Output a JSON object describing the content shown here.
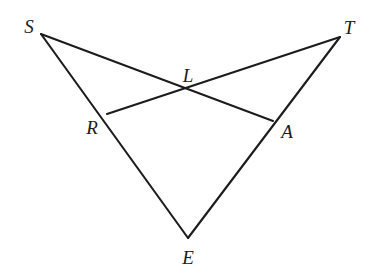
{
  "figure": {
    "type": "geometry-diagram",
    "background_color": "#ffffff",
    "stroke_color": "#1c1c1c",
    "stroke_width": 2.1,
    "canvas": {
      "width": 374,
      "height": 276
    },
    "points": [
      {
        "id": "S",
        "label": "S",
        "x": 41,
        "y": 34,
        "label_x": 29,
        "label_y": 26
      },
      {
        "id": "T",
        "label": "T",
        "x": 340,
        "y": 37,
        "label_x": 349,
        "label_y": 27
      },
      {
        "id": "L",
        "label": "L",
        "x": 188,
        "y": 91,
        "label_x": 188,
        "label_y": 75
      },
      {
        "id": "R",
        "label": "R",
        "x": 107,
        "y": 114,
        "label_x": 92,
        "label_y": 127
      },
      {
        "id": "A",
        "label": "A",
        "x": 273,
        "y": 121,
        "label_x": 287,
        "label_y": 131
      },
      {
        "id": "E",
        "label": "E",
        "x": 188,
        "y": 238,
        "label_x": 188,
        "label_y": 257
      }
    ],
    "segments": [
      {
        "id": "S-A",
        "from": "S",
        "to": "A",
        "through": "L",
        "x1": 41,
        "y1": 34,
        "x2": 273,
        "y2": 121
      },
      {
        "id": "T-R",
        "from": "T",
        "to": "R",
        "through": "L",
        "x1": 340,
        "y1": 37,
        "x2": 107,
        "y2": 114
      },
      {
        "id": "S-E",
        "from": "S",
        "to": "E",
        "through": "R",
        "x1": 41,
        "y1": 34,
        "x2": 188,
        "y2": 238
      },
      {
        "id": "T-E",
        "from": "T",
        "to": "E",
        "through": "A",
        "x1": 340,
        "y1": 37,
        "x2": 188,
        "y2": 238
      }
    ]
  }
}
